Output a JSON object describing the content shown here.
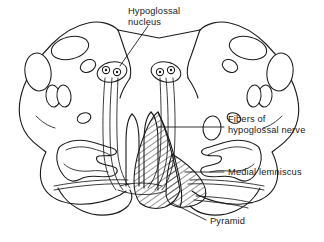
{
  "figure": {
    "background_color": "#ffffff",
    "line_color": "#1a1a1a",
    "labels": {
      "hypoglossal_nucleus": {
        "line1": "Hypoglossal",
        "line2": "nucleus"
      },
      "fibers_of_hypoglossal_nerve": {
        "line1": "Fibers of",
        "line2": "hypoglossal nerve"
      },
      "medial_lemniscus": {
        "line1": "Medial lemniscus"
      },
      "pyramid": {
        "line1": "Pyramid"
      }
    },
    "structures": [
      "brainstem-outline",
      "hypoglossal-nucleus-left",
      "hypoglossal-nucleus-right",
      "hypoglossal-fiber-tract-left",
      "hypoglossal-fiber-tract-right",
      "inferior-olivary-nucleus-left",
      "inferior-olivary-nucleus-right",
      "pyramid-hatched-region",
      "medial-lemniscus-band"
    ]
  }
}
